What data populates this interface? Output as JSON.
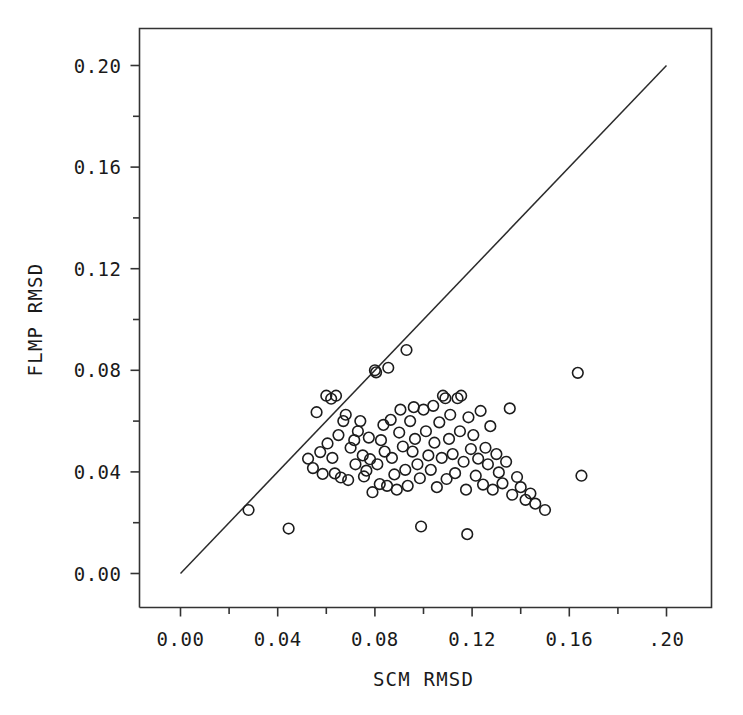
{
  "figure": {
    "width": 743,
    "height": 715,
    "background": "#ffffff",
    "ink_color": "#1a1a1a"
  },
  "chart_data": {
    "type": "scatter",
    "title": "",
    "xlabel": "SCM RMSD",
    "ylabel": "FLMP RMSD",
    "xlim": [
      0.0,
      0.2
    ],
    "ylim": [
      0.0,
      0.2
    ],
    "grid": false,
    "legend": null,
    "marker": "open-circle",
    "x_tick_labels": [
      "0.00",
      "0.04",
      "0.08",
      "0.12",
      "0.16",
      ".20"
    ],
    "x_tick_values": [
      0.0,
      0.04,
      0.08,
      0.12,
      0.16,
      0.2
    ],
    "x_minor_tick_values": [
      0.02,
      0.06,
      0.1,
      0.14,
      0.18
    ],
    "y_tick_labels": [
      "0.00",
      "0.04",
      "0.08",
      "0.12",
      "0.16",
      "0.20"
    ],
    "y_tick_values": [
      0.0,
      0.04,
      0.08,
      0.12,
      0.16,
      0.2
    ],
    "y_minor_tick_values": [
      0.02,
      0.06,
      0.1,
      0.14,
      0.18
    ],
    "reference_line": {
      "name": "identity-line",
      "from": [
        0.0,
        0.0
      ],
      "to": [
        0.2,
        0.2
      ],
      "description": "y = x diagonal"
    },
    "points": [
      [
        0.028,
        0.025
      ],
      [
        0.0445,
        0.0177
      ],
      [
        0.0525,
        0.0452
      ],
      [
        0.0545,
        0.0415
      ],
      [
        0.056,
        0.0635
      ],
      [
        0.0575,
        0.0478
      ],
      [
        0.0585,
        0.0392
      ],
      [
        0.06,
        0.07
      ],
      [
        0.0605,
        0.0512
      ],
      [
        0.062,
        0.0688
      ],
      [
        0.0625,
        0.0455
      ],
      [
        0.0635,
        0.0394
      ],
      [
        0.064,
        0.07
      ],
      [
        0.065,
        0.0545
      ],
      [
        0.066,
        0.0378
      ],
      [
        0.067,
        0.06
      ],
      [
        0.068,
        0.0625
      ],
      [
        0.069,
        0.0368
      ],
      [
        0.07,
        0.0495
      ],
      [
        0.0715,
        0.0525
      ],
      [
        0.072,
        0.043
      ],
      [
        0.073,
        0.056
      ],
      [
        0.074,
        0.06
      ],
      [
        0.075,
        0.0465
      ],
      [
        0.0755,
        0.0382
      ],
      [
        0.0765,
        0.0405
      ],
      [
        0.0775,
        0.0535
      ],
      [
        0.078,
        0.045
      ],
      [
        0.079,
        0.032
      ],
      [
        0.08,
        0.08
      ],
      [
        0.0805,
        0.0792
      ],
      [
        0.081,
        0.043
      ],
      [
        0.082,
        0.0352
      ],
      [
        0.0825,
        0.0525
      ],
      [
        0.0835,
        0.0585
      ],
      [
        0.084,
        0.048
      ],
      [
        0.085,
        0.0345
      ],
      [
        0.0855,
        0.081
      ],
      [
        0.0865,
        0.0605
      ],
      [
        0.087,
        0.0455
      ],
      [
        0.088,
        0.039
      ],
      [
        0.089,
        0.033
      ],
      [
        0.09,
        0.0555
      ],
      [
        0.0905,
        0.0645
      ],
      [
        0.0915,
        0.05
      ],
      [
        0.0925,
        0.0408
      ],
      [
        0.093,
        0.088
      ],
      [
        0.0935,
        0.0345
      ],
      [
        0.0945,
        0.06
      ],
      [
        0.0955,
        0.048
      ],
      [
        0.096,
        0.0655
      ],
      [
        0.0965,
        0.053
      ],
      [
        0.0975,
        0.043
      ],
      [
        0.0985,
        0.0375
      ],
      [
        0.099,
        0.0185
      ],
      [
        0.1,
        0.0645
      ],
      [
        0.101,
        0.056
      ],
      [
        0.102,
        0.0465
      ],
      [
        0.103,
        0.0408
      ],
      [
        0.104,
        0.066
      ],
      [
        0.1045,
        0.0515
      ],
      [
        0.1055,
        0.034
      ],
      [
        0.1065,
        0.0595
      ],
      [
        0.1075,
        0.0455
      ],
      [
        0.108,
        0.07
      ],
      [
        0.109,
        0.069
      ],
      [
        0.1095,
        0.0372
      ],
      [
        0.1105,
        0.053
      ],
      [
        0.111,
        0.0625
      ],
      [
        0.112,
        0.047
      ],
      [
        0.113,
        0.0395
      ],
      [
        0.114,
        0.069
      ],
      [
        0.115,
        0.056
      ],
      [
        0.1155,
        0.07
      ],
      [
        0.1165,
        0.044
      ],
      [
        0.1175,
        0.033
      ],
      [
        0.1185,
        0.0615
      ],
      [
        0.1195,
        0.049
      ],
      [
        0.1205,
        0.0545
      ],
      [
        0.1215,
        0.0385
      ],
      [
        0.1225,
        0.0452
      ],
      [
        0.1235,
        0.064
      ],
      [
        0.1245,
        0.035
      ],
      [
        0.1255,
        0.0495
      ],
      [
        0.1265,
        0.043
      ],
      [
        0.1275,
        0.058
      ],
      [
        0.1285,
        0.033
      ],
      [
        0.13,
        0.047
      ],
      [
        0.131,
        0.0398
      ],
      [
        0.1325,
        0.0355
      ],
      [
        0.134,
        0.044
      ],
      [
        0.1355,
        0.065
      ],
      [
        0.1365,
        0.031
      ],
      [
        0.1385,
        0.038
      ],
      [
        0.14,
        0.034
      ],
      [
        0.142,
        0.029
      ],
      [
        0.144,
        0.0315
      ],
      [
        0.146,
        0.0275
      ],
      [
        0.15,
        0.025
      ],
      [
        0.118,
        0.0155
      ],
      [
        0.1635,
        0.079
      ],
      [
        0.165,
        0.0385
      ]
    ]
  }
}
